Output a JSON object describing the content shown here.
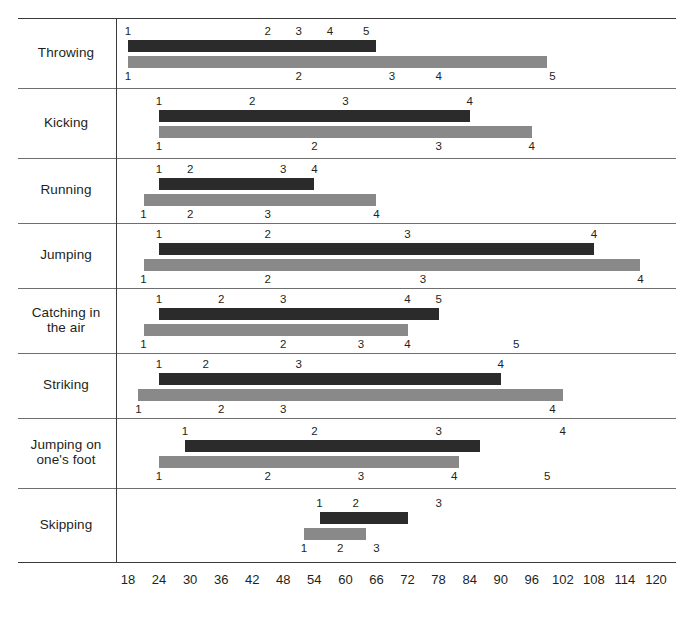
{
  "chart_data": {
    "type": "bar",
    "title": "",
    "xlabel": "",
    "ylabel": "",
    "orientation": "horizontal",
    "grid": false,
    "legend_position": "none",
    "xlim": [
      18,
      120
    ],
    "xticks": [
      18,
      24,
      30,
      36,
      42,
      48,
      54,
      60,
      66,
      72,
      78,
      84,
      90,
      96,
      102,
      108,
      114,
      120
    ],
    "xtick_labels": [
      "18",
      "24",
      "30",
      "36",
      "42",
      "48",
      "54",
      "60",
      "66",
      "72",
      "78",
      "84",
      "90",
      "96",
      "102",
      "108",
      "114",
      "120"
    ],
    "categories": [
      "Throwing",
      "Kicking",
      "Running",
      "Jumping",
      "Catching in the air",
      "Striking",
      "Jumping on one's foot",
      "Skipping"
    ],
    "series": [
      {
        "name": "upper-dark",
        "color": "#2b2b2b",
        "ranges": [
          {
            "start": 18,
            "end": 66
          },
          {
            "start": 24,
            "end": 84
          },
          {
            "start": 24,
            "end": 54
          },
          {
            "start": 24,
            "end": 108
          },
          {
            "start": 24,
            "end": 78
          },
          {
            "start": 24,
            "end": 90
          },
          {
            "start": 29,
            "end": 86
          },
          {
            "start": 55,
            "end": 72
          }
        ],
        "stage_marks": [
          [
            18,
            45,
            51,
            57,
            64
          ],
          [
            24,
            42,
            60,
            84
          ],
          [
            24,
            30,
            48,
            54
          ],
          [
            24,
            45,
            72,
            108
          ],
          [
            24,
            36,
            48,
            72,
            78
          ],
          [
            24,
            33,
            51,
            90
          ],
          [
            29,
            54,
            78,
            102
          ],
          [
            55,
            62,
            78
          ]
        ]
      },
      {
        "name": "lower-grey",
        "color": "#898989",
        "ranges": [
          {
            "start": 18,
            "end": 99
          },
          {
            "start": 24,
            "end": 96
          },
          {
            "start": 21,
            "end": 66
          },
          {
            "start": 21,
            "end": 117
          },
          {
            "start": 21,
            "end": 72
          },
          {
            "start": 20,
            "end": 102
          },
          {
            "start": 24,
            "end": 82
          },
          {
            "start": 52,
            "end": 64
          }
        ],
        "stage_marks": [
          [
            18,
            51,
            69,
            78,
            100
          ],
          [
            24,
            54,
            78,
            96
          ],
          [
            21,
            30,
            45,
            66
          ],
          [
            21,
            45,
            75,
            117
          ],
          [
            21,
            48,
            63,
            72,
            93
          ],
          [
            20,
            36,
            48,
            100
          ],
          [
            24,
            45,
            63,
            81,
            99
          ],
          [
            52,
            59,
            66
          ]
        ]
      }
    ],
    "stage_labels": [
      "1",
      "2",
      "3",
      "4",
      "5"
    ]
  },
  "rows": [
    {
      "label": "Throwing"
    },
    {
      "label": "Kicking"
    },
    {
      "label": "Running"
    },
    {
      "label": "Jumping"
    },
    {
      "label": "Catching in\nthe air"
    },
    {
      "label": "Striking"
    },
    {
      "label": "Jumping on\none's foot"
    },
    {
      "label": "Skipping"
    }
  ],
  "axis": {
    "labels": [
      "18",
      "24",
      "30",
      "36",
      "42",
      "48",
      "54",
      "60",
      "66",
      "72",
      "78",
      "84",
      "90",
      "96",
      "102",
      "108",
      "114",
      "120"
    ]
  },
  "colors": {
    "dark_bar": "#2b2b2b",
    "grey_bar": "#898989",
    "rule": "#6f6f6f",
    "text": "#231f20"
  }
}
